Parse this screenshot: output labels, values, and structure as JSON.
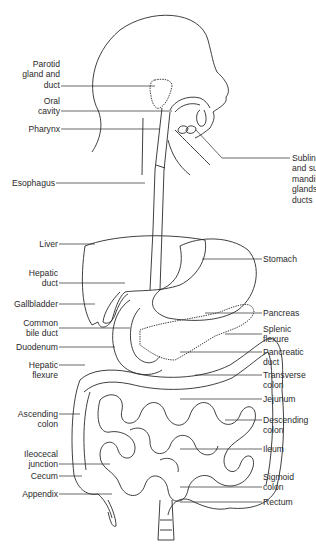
{
  "diagram": {
    "labels_left": [
      {
        "id": "parotid",
        "lines": [
          "Parotid",
          "gland and",
          "duct"
        ]
      },
      {
        "id": "oral-cavity",
        "lines": [
          "Oral",
          "cavity"
        ]
      },
      {
        "id": "pharynx",
        "lines": [
          "Pharynx"
        ]
      },
      {
        "id": "esophagus",
        "lines": [
          "Esophagus"
        ]
      },
      {
        "id": "liver",
        "lines": [
          "Liver"
        ]
      },
      {
        "id": "hepatic-duct",
        "lines": [
          "Hepatic",
          "duct"
        ]
      },
      {
        "id": "gallbladder",
        "lines": [
          "Gallbladder"
        ]
      },
      {
        "id": "common-bile-duct",
        "lines": [
          "Common",
          "bile duct"
        ]
      },
      {
        "id": "duodenum",
        "lines": [
          "Duodenum"
        ]
      },
      {
        "id": "hepatic-flexure",
        "lines": [
          "Hepatic",
          "flexure"
        ]
      },
      {
        "id": "ascending-colon",
        "lines": [
          "Ascending",
          "colon"
        ]
      },
      {
        "id": "ileocecal-junction",
        "lines": [
          "Ileocecal",
          "junction"
        ]
      },
      {
        "id": "cecum",
        "lines": [
          "Cecum"
        ]
      },
      {
        "id": "appendix",
        "lines": [
          "Appendix"
        ]
      }
    ],
    "labels_right": [
      {
        "id": "sublingual",
        "lines": [
          "Sublingual",
          "and sub-",
          "mandibular",
          "glands and",
          "ducts"
        ]
      },
      {
        "id": "stomach",
        "lines": [
          "Stomach"
        ]
      },
      {
        "id": "pancreas",
        "lines": [
          "Pancreas"
        ]
      },
      {
        "id": "splenic-flexure",
        "lines": [
          "Splenic",
          "flexure"
        ]
      },
      {
        "id": "pancreatic-duct",
        "lines": [
          "Pancreatic",
          "duct"
        ]
      },
      {
        "id": "transverse-colon",
        "lines": [
          "Transverse",
          "colon"
        ]
      },
      {
        "id": "jejunum",
        "lines": [
          "Jejunum"
        ]
      },
      {
        "id": "descending-colon",
        "lines": [
          "Descending",
          "colon"
        ]
      },
      {
        "id": "ileum",
        "lines": [
          "Ileum"
        ]
      },
      {
        "id": "sigmoid-colon",
        "lines": [
          "Sigmoid",
          "colon"
        ]
      },
      {
        "id": "rectum",
        "lines": [
          "Rectum"
        ]
      }
    ],
    "colors": {
      "line": "#2a2a2a",
      "background": "#ffffff"
    }
  }
}
